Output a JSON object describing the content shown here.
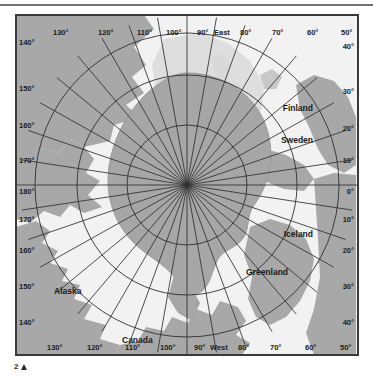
{
  "figure": {
    "caption_number": "2",
    "caption_marker": "triangle-up"
  },
  "map": {
    "projection": "polar-azimuthal-north",
    "title": "Arctic Polar Region",
    "colors": {
      "land": "#a8a8a8",
      "land_dark": "#9a9a9a",
      "ice_cap": "#a6a6a6",
      "sea": "#f2f2f2",
      "sea_shelf": "#d8d8d8",
      "graticule": "#2f2f2f",
      "border": "#3a3a3a",
      "label_text": "#1a1a1a",
      "rule": "#6e7275"
    },
    "hemisphere_labels": {
      "east": "East",
      "west": "West"
    },
    "place_labels": [
      {
        "name": "Finland",
        "x": 313,
        "y": 105
      },
      {
        "name": "Sweden",
        "x": 311,
        "y": 137
      },
      {
        "name": "Iceland",
        "x": 312,
        "y": 231
      },
      {
        "name": "Greenland",
        "x": 268,
        "y": 268
      },
      {
        "name": "Alaska",
        "x": 62,
        "y": 287
      },
      {
        "name": "Canada",
        "x": 130,
        "y": 343
      }
    ],
    "meridian_labels_top": [
      {
        "text": "130°",
        "x": 39,
        "y": 22
      },
      {
        "text": "120°",
        "x": 84,
        "y": 22
      },
      {
        "text": "110°",
        "x": 123,
        "y": 22
      },
      {
        "text": "100°",
        "x": 152,
        "y": 22
      },
      {
        "text": "90°",
        "x": 185,
        "y": 22
      },
      {
        "text": "80°",
        "x": 222,
        "y": 22
      },
      {
        "text": "70°",
        "x": 254,
        "y": 22
      },
      {
        "text": "60°",
        "x": 291,
        "y": 22
      },
      {
        "text": "50°",
        "x": 330,
        "y": 22
      }
    ],
    "meridian_labels_bottom": [
      {
        "text": "130°",
        "x": 43,
        "y": 352
      },
      {
        "text": "120°",
        "x": 85,
        "y": 352
      },
      {
        "text": "110°",
        "x": 122,
        "y": 352
      },
      {
        "text": "100°",
        "x": 155,
        "y": 352
      },
      {
        "text": "90°",
        "x": 186,
        "y": 352
      },
      {
        "text": "80°",
        "x": 224,
        "y": 352
      },
      {
        "text": "70°",
        "x": 255,
        "y": 352
      },
      {
        "text": "60°",
        "x": 292,
        "y": 352
      },
      {
        "text": "50°",
        "x": 330,
        "y": 352
      }
    ],
    "meridian_labels_left": [
      {
        "text": "140°",
        "x": 18,
        "y": 40
      },
      {
        "text": "150°",
        "x": 18,
        "y": 88
      },
      {
        "text": "160°",
        "x": 18,
        "y": 124
      },
      {
        "text": "170°",
        "x": 18,
        "y": 159
      },
      {
        "text": "180°",
        "x": 18,
        "y": 190
      },
      {
        "text": "170°",
        "x": 18,
        "y": 218
      },
      {
        "text": "160°",
        "x": 18,
        "y": 249
      },
      {
        "text": "150°",
        "x": 18,
        "y": 285
      },
      {
        "text": "140°",
        "x": 18,
        "y": 321
      }
    ],
    "meridian_labels_right": [
      {
        "text": "40°",
        "x": 340,
        "y": 44
      },
      {
        "text": "30°",
        "x": 340,
        "y": 89
      },
      {
        "text": "20°",
        "x": 340,
        "y": 126
      },
      {
        "text": "10°",
        "x": 340,
        "y": 158
      },
      {
        "text": "0°",
        "x": 342,
        "y": 190
      },
      {
        "text": "10°",
        "x": 340,
        "y": 218
      },
      {
        "text": "20°",
        "x": 340,
        "y": 249
      },
      {
        "text": "30°",
        "x": 340,
        "y": 285
      },
      {
        "text": "40°",
        "x": 340,
        "y": 321
      }
    ],
    "graticule": {
      "meridian_count": 36,
      "meridian_step_deg": 10,
      "parallels": [
        {
          "label": "",
          "radius": 60
        },
        {
          "label": "",
          "radius": 110
        },
        {
          "label": "",
          "radius": 152
        }
      ],
      "center_x": 173,
      "center_y": 172,
      "grid_on": true
    }
  }
}
